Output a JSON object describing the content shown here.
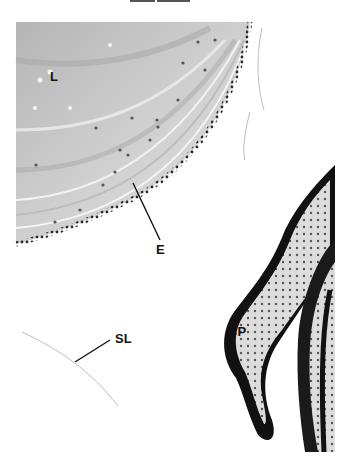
{
  "figure": {
    "labels": {
      "lens": "L",
      "epithelium": "E",
      "ciliary_process": "CP",
      "suspensory_ligament": "SL"
    },
    "colors": {
      "background": "#ffffff",
      "lens_fiber": "#c9c9c9",
      "lens_dark": "#9a9a9a",
      "epithelium_nuclei": "#3a3a3a",
      "ciliary_epithelium": "#1a1a1a",
      "stroma": "#d8d8d8",
      "label_text": "#111111"
    }
  }
}
